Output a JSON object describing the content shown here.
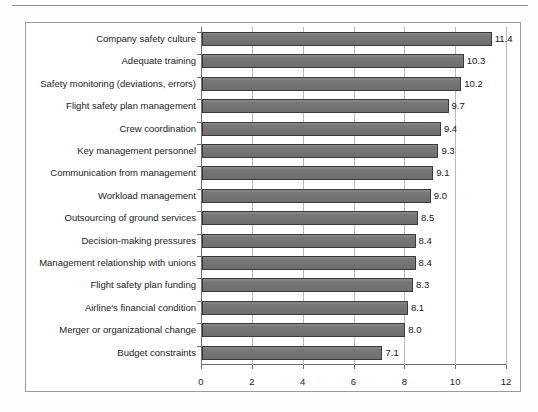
{
  "chart_data": {
    "type": "bar",
    "orientation": "horizontal",
    "title": "",
    "subtitle": "",
    "xlabel": "",
    "ylabel": "",
    "xlim": [
      0,
      12
    ],
    "xticks": [
      "0",
      "2",
      "4",
      "6",
      "8",
      "10",
      "12"
    ],
    "xtick_values": [
      0,
      2,
      4,
      6,
      8,
      10,
      12
    ],
    "grid": "vertical",
    "legend": "none",
    "bar_color": "#787878",
    "bar_edge_color": "#3a3a3a",
    "categories": [
      "Company safety culture",
      "Adequate training",
      "Safety monitoring (deviations, errors)",
      "Flight safety plan management",
      "Crew coordination",
      "Key management personnel",
      "Communication from management",
      "Workload management",
      "Outsourcing of ground services",
      "Decision-making pressures",
      "Management relationship with unions",
      "Flight safety plan funding",
      "Airline's financial condition",
      "Merger or organizational change",
      "Budget constraints"
    ],
    "values": [
      11.4,
      10.3,
      10.2,
      9.7,
      9.4,
      9.3,
      9.1,
      9.0,
      8.5,
      8.4,
      8.4,
      8.3,
      8.1,
      8.0,
      7.1
    ],
    "value_labels": [
      "11.4",
      "10.3",
      "10.2",
      "9.7",
      "9.4",
      "9.3",
      "9.1",
      "9.0",
      "8.5",
      "8.4",
      "8.4",
      "8.3",
      "8.1",
      "8.0",
      "7.1"
    ]
  }
}
